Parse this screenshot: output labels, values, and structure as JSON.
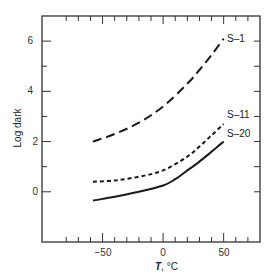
{
  "chart_data": {
    "type": "line",
    "title": "",
    "xlabel": "T, °C",
    "xlabel_italic_part": "T",
    "xlabel_rest": ", °C",
    "ylabel": "Log dark",
    "xlim": [
      -100,
      80
    ],
    "ylim": [
      -2,
      7
    ],
    "x_ticks_major": [
      -50,
      0,
      50
    ],
    "x_ticks_minor": [
      -80,
      -70,
      -60,
      -40,
      -30,
      -20,
      -10,
      10,
      20,
      30,
      40,
      60,
      70
    ],
    "y_ticks_major": [
      0,
      2,
      4,
      6
    ],
    "y_ticks_minor": [
      1,
      3,
      5
    ],
    "right_ticks": [
      0,
      1,
      2,
      3,
      4,
      5,
      6
    ],
    "top_ticks": [
      -80,
      -70,
      -60,
      -50,
      -40,
      -30,
      -20,
      -10,
      0,
      10,
      20,
      30,
      40,
      50,
      60,
      70
    ],
    "grid": false,
    "legend": "inline labels at right end of curves",
    "series": [
      {
        "name": "S–1",
        "style": "long-dash",
        "x": [
          -58,
          -40,
          -20,
          0,
          20,
          30,
          40,
          50
        ],
        "y": [
          2.0,
          2.3,
          2.75,
          3.4,
          4.3,
          4.85,
          5.45,
          6.1
        ]
      },
      {
        "name": "S–11",
        "style": "short-dash",
        "x": [
          -58,
          -40,
          -20,
          0,
          20,
          30,
          40,
          50
        ],
        "y": [
          0.4,
          0.45,
          0.6,
          0.85,
          1.4,
          1.8,
          2.25,
          2.7
        ]
      },
      {
        "name": "S–20",
        "style": "solid",
        "x": [
          -58,
          -40,
          -20,
          0,
          10,
          20,
          30,
          40,
          50
        ],
        "y": [
          -0.35,
          -0.2,
          0.0,
          0.25,
          0.5,
          0.85,
          1.2,
          1.6,
          2.0
        ]
      }
    ]
  },
  "labels": {
    "ylabel": "Log dark",
    "xlabel_T": "T",
    "xlabel_unit": ", °C",
    "x_tick_m50": "−50",
    "x_tick_0": "0",
    "x_tick_50": "50",
    "y_tick_0": "0",
    "y_tick_2": "2",
    "y_tick_4": "4",
    "y_tick_6": "6",
    "s1": "S–1",
    "s11": "S–11",
    "s20": "S–20"
  },
  "colors": {
    "ink": "#1a1a1a",
    "frame": "#333333",
    "background": "#ffffff"
  }
}
